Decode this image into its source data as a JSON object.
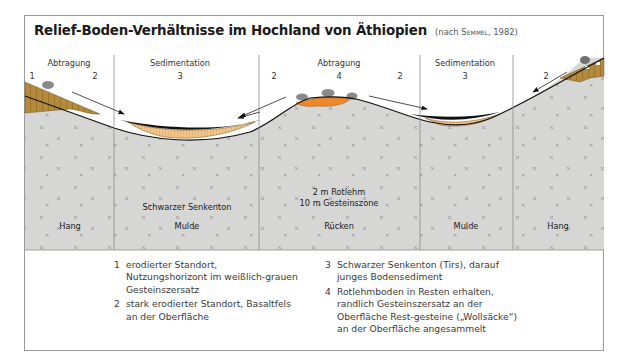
{
  "title": {
    "main": "Relief-Boden-Verhältnisse im Hochland von Äthiopien",
    "citation_prefix": "(nach ",
    "citation_author": "Semmel",
    "citation_suffix": ", 1982)"
  },
  "diagram": {
    "columns": [
      {
        "header": "Abtragung",
        "numbers": [
          "1",
          "2"
        ],
        "bottom_label": "Hang"
      },
      {
        "header": "Sedimentation",
        "numbers": [
          "3"
        ],
        "inner_label": "Schwarzer Senkenton",
        "bottom_label": "Mulde"
      },
      {
        "header": "Abtragung",
        "numbers": [
          "2",
          "4",
          "2"
        ],
        "inner_label_line1": "2 m Rotlehm",
        "inner_label_line2": "10 m Gesteinszone",
        "bottom_label": "Rücken"
      },
      {
        "header": "Sedimentation",
        "numbers": [
          "3"
        ],
        "bottom_label": "Mulde"
      },
      {
        "header": "",
        "numbers": [
          "2"
        ],
        "bottom_label": "Hang"
      }
    ],
    "colors": {
      "bedrock": "#d6d6d4",
      "eroded_soil": "#b58a3a",
      "sediment": "#f3c68a",
      "black_clay": "#111111",
      "red_loam": "#ec8a2a",
      "boulders": "#8a8a8a",
      "divider": "#8c8c8c"
    }
  },
  "legend": {
    "left": [
      {
        "num": "1",
        "text": "erodierter Standort, Nutzungshorizont im weißlich-grauen Gesteinszersatz"
      },
      {
        "num": "2",
        "text": "stark erodierter Standort, Basaltfels an der Oberfläche"
      }
    ],
    "right": [
      {
        "num": "3",
        "text": "Schwarzer Senkenton (Tirs), darauf junges Bodensediment"
      },
      {
        "num": "4",
        "text": "Rotlehmboden in Resten erhalten, randlich Gesteinszersatz an der Oberfläche Rest-gesteine („Wollsäcke“) an der Oberfläche angesammelt"
      }
    ]
  }
}
